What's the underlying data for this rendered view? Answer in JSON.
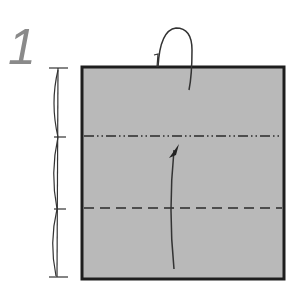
{
  "step": {
    "number": "1"
  },
  "paper": {
    "fill": "#b8b8b8",
    "edge": "#222222",
    "x": 82,
    "y": 67,
    "width": 202,
    "height": 212
  },
  "folds": [
    {
      "type": "mountain-fold",
      "y": 136,
      "style": "dash-dot-dot"
    },
    {
      "type": "valley-fold",
      "y": 208,
      "style": "dashed"
    }
  ],
  "arrows": [
    {
      "type": "fold-behind-arrow",
      "description": "loop arrow over top edge"
    },
    {
      "type": "valley-fold-arrow",
      "description": "curved arrow pointing up"
    }
  ],
  "measure": {
    "divisions": 3,
    "description": "equal thirds marker"
  }
}
